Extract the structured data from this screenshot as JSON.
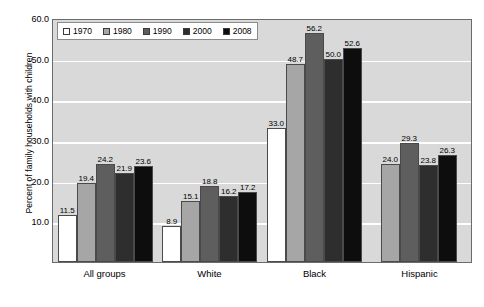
{
  "chart_data": {
    "type": "bar",
    "title": "",
    "subtitle": "",
    "xlabel": "",
    "ylabel": "Percent of family households with children",
    "ylim": [
      0,
      60
    ],
    "ytick_step": 10,
    "ytick_labels": [
      "60.0",
      "50.0",
      "40.0",
      "30.0",
      "20.0",
      "10.0"
    ],
    "ytick_values": [
      60,
      50,
      40,
      30,
      20,
      10
    ],
    "grid": true,
    "grid_axis": "y",
    "legend_position": "top-left-inside",
    "categories": [
      "All groups",
      "White",
      "Black",
      "Hispanic"
    ],
    "series": [
      {
        "name": "1970",
        "color": "#ffffff",
        "values": [
          11.5,
          8.9,
          33.0,
          null
        ],
        "labels": [
          "11.5",
          "8.9",
          "33.0",
          ""
        ]
      },
      {
        "name": "1980",
        "color": "#a6a6a6",
        "values": [
          19.4,
          15.1,
          48.7,
          24.0
        ],
        "labels": [
          "19.4",
          "15.1",
          "48.7",
          "24.0"
        ]
      },
      {
        "name": "1990",
        "color": "#5e5e5e",
        "values": [
          24.2,
          18.8,
          56.2,
          29.3
        ],
        "labels": [
          "24.2",
          "18.8",
          "56.2",
          "29.3"
        ]
      },
      {
        "name": "2000",
        "color": "#2e2e2e",
        "values": [
          21.9,
          16.2,
          50.0,
          23.8
        ],
        "labels": [
          "21.9",
          "16.2",
          "50.0",
          "23.8"
        ]
      },
      {
        "name": "2008",
        "color": "#0d0d0d",
        "values": [
          23.6,
          17.2,
          52.6,
          26.3
        ],
        "labels": [
          "23.6",
          "17.2",
          "52.6",
          "26.3"
        ]
      }
    ]
  },
  "legend": {
    "items": [
      {
        "label": "1970",
        "color": "#ffffff"
      },
      {
        "label": "1980",
        "color": "#a6a6a6"
      },
      {
        "label": "1990",
        "color": "#5e5e5e"
      },
      {
        "label": "2000",
        "color": "#2e2e2e"
      },
      {
        "label": "2008",
        "color": "#0d0d0d"
      }
    ]
  },
  "colors": {
    "plot_background": "#d9d9d9",
    "gridline": "#ffffff",
    "axis_border": "#6b6b6b",
    "bar_outline": "#4a4a4a",
    "text": "#000000"
  }
}
